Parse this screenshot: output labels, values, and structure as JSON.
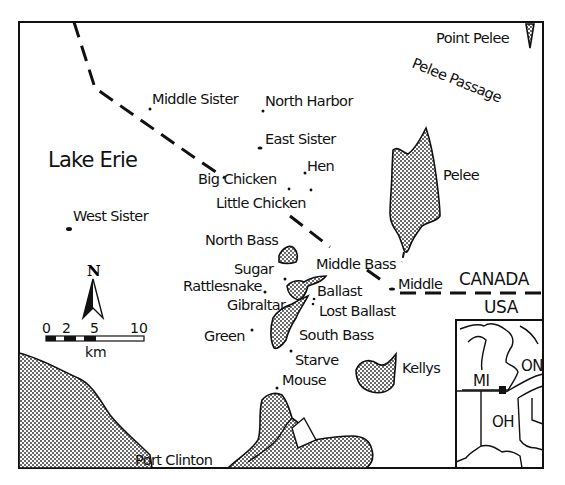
{
  "map": {
    "title": "Lake Erie",
    "water_body": "Lake Erie",
    "colors": {
      "ink": "#111111",
      "background": "#ffffff",
      "land_pattern": "stippled"
    },
    "countries": {
      "north": "CANADA",
      "south": "USA"
    },
    "features": {
      "point_pelee": "Point Pelee",
      "pelee_passage": "Pelee Passage",
      "port_clinton": "Port Clinton"
    },
    "islands": [
      {
        "name": "Middle Sister"
      },
      {
        "name": "North Harbor"
      },
      {
        "name": "East Sister"
      },
      {
        "name": "Hen"
      },
      {
        "name": "Big Chicken"
      },
      {
        "name": "Little Chicken"
      },
      {
        "name": "West Sister"
      },
      {
        "name": "Pelee"
      },
      {
        "name": "North Bass"
      },
      {
        "name": "Middle Bass"
      },
      {
        "name": "Middle"
      },
      {
        "name": "Sugar"
      },
      {
        "name": "Rattlesnake"
      },
      {
        "name": "Ballast"
      },
      {
        "name": "Gibraltar"
      },
      {
        "name": "Lost Ballast"
      },
      {
        "name": "Green"
      },
      {
        "name": "South Bass"
      },
      {
        "name": "Starve"
      },
      {
        "name": "Mouse"
      },
      {
        "name": "Kellys"
      }
    ],
    "compass": {
      "label": "N"
    },
    "scale_bar": {
      "ticks": [
        "0",
        "2",
        "5",
        "10"
      ],
      "unit": "km"
    },
    "inset": {
      "labels": [
        "MI",
        "ON",
        "OH"
      ]
    }
  }
}
